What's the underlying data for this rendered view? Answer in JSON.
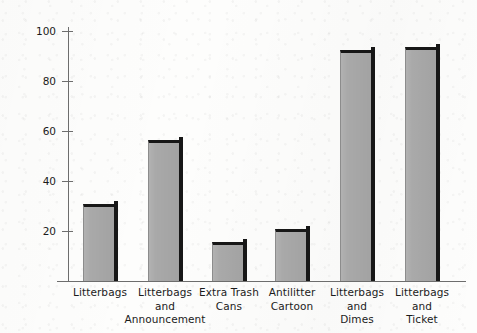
{
  "chart_data": {
    "type": "bar",
    "title": "",
    "subtitle": "",
    "xlabel": "",
    "ylabel": "Percentage of Litter Returned by Audience",
    "categories": [
      "Litterbags",
      "Litterbags and Announcement",
      "Extra Trash Cans",
      "Antilitter Cartoon",
      "Litterbags and Dimes",
      "Litterbags and Ticket"
    ],
    "category_lines": [
      [
        "Litterbags"
      ],
      [
        "Litterbags",
        "and",
        "Announcement"
      ],
      [
        "Extra Trash",
        "Cans"
      ],
      [
        "Antilitter",
        "Cartoon"
      ],
      [
        "Litterbags",
        "and",
        "Dimes"
      ],
      [
        "Litterbags",
        "and",
        "Ticket"
      ]
    ],
    "values": [
      31,
      56.5,
      15.5,
      21,
      92.5,
      93.5
    ],
    "ylim": [
      0,
      100
    ],
    "yticks": [
      20,
      40,
      60,
      80,
      100
    ],
    "ytick_labels": [
      "20",
      "40",
      "60",
      "80",
      "100"
    ],
    "grid": false,
    "legend": null,
    "bar_fill_color": "#a9a9a9",
    "bar_edge_color": "#171717",
    "axis_color": "#6d6d6d",
    "background_color": "#fdfdfc"
  }
}
